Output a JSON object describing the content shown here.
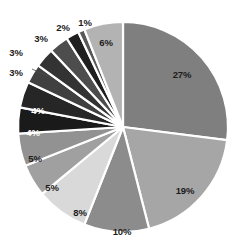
{
  "chart": {
    "title": "",
    "background_color": "#ffffff",
    "separator_color": "#ffffff",
    "center_x": 123,
    "center_y": 127,
    "radius": 105,
    "start_angle_deg": 0,
    "direction": "clockwise"
  },
  "chart_data": {
    "type": "pie",
    "title": "",
    "subtitle": "",
    "xlabel": "",
    "ylabel": "",
    "legend": "none",
    "grid": false,
    "total": 100,
    "unit": "%",
    "categories": [
      "Segment 1",
      "Segment 2",
      "Segment 3",
      "Segment 4",
      "Segment 5",
      "Segment 6",
      "Segment 7",
      "Segment 8",
      "Segment 9",
      "Segment 10",
      "Segment 11",
      "Segment 12",
      "Segment 13",
      "Segment 14"
    ],
    "values": [
      27,
      19,
      10,
      8,
      5,
      5,
      4,
      4,
      3,
      3,
      3,
      2,
      1,
      6
    ],
    "labels": [
      "27%",
      "19%",
      "10%",
      "8%",
      "5%",
      "5%",
      "4%",
      "4%",
      "3%",
      "3%",
      "3%",
      "2%",
      "1%",
      "6%"
    ],
    "colors": [
      "#7f7f7f",
      "#a6a6a6",
      "#8c8c8c",
      "#d9d9d9",
      "#a0a0a0",
      "#929292",
      "#1a1a1a",
      "#262626",
      "#404040",
      "#333333",
      "#4d4d4d",
      "#1f1f1f",
      "#595959",
      "#b3b3b3"
    ]
  },
  "labels": [
    {
      "text": "27%",
      "x": 182,
      "y": 75,
      "style": "dark",
      "outside": false
    },
    {
      "text": "19%",
      "x": 185,
      "y": 191,
      "style": "dark",
      "outside": false
    },
    {
      "text": "10%",
      "x": 122,
      "y": 232,
      "style": "dark",
      "outside": false
    },
    {
      "text": "8%",
      "x": 80,
      "y": 213,
      "style": "dark",
      "outside": false
    },
    {
      "text": "5%",
      "x": 52,
      "y": 188,
      "style": "dark",
      "outside": false
    },
    {
      "text": "5%",
      "x": 35,
      "y": 159,
      "style": "dark",
      "outside": false
    },
    {
      "text": "4%",
      "x": 33,
      "y": 133,
      "style": "light",
      "outside": false
    },
    {
      "text": "4%",
      "x": 38,
      "y": 111,
      "style": "light",
      "outside": false
    },
    {
      "text": "3%",
      "x": 16,
      "y": 73,
      "style": "dark",
      "outside": true
    },
    {
      "text": "3%",
      "x": 16,
      "y": 53,
      "style": "dark",
      "outside": true
    },
    {
      "text": "3%",
      "x": 41,
      "y": 39,
      "style": "dark",
      "outside": true
    },
    {
      "text": "2%",
      "x": 63,
      "y": 28,
      "style": "dark",
      "outside": true
    },
    {
      "text": "1%",
      "x": 85,
      "y": 23,
      "style": "dark",
      "outside": true
    },
    {
      "text": "6%",
      "x": 106,
      "y": 43,
      "style": "dark",
      "outside": false
    }
  ],
  "leader_lines": [
    {
      "x1": 32,
      "y1": 69,
      "x2": 52,
      "y2": 78
    }
  ]
}
